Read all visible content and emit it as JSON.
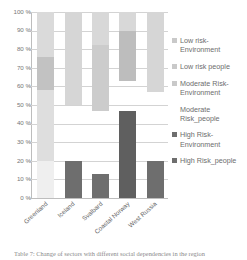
{
  "chart_data": {
    "type": "bar",
    "subtype": "stacked-percentage-column",
    "title": "",
    "xlabel": "",
    "ylabel": "",
    "ylim": [
      0,
      100
    ],
    "ytick_labels": [
      "100 %",
      "90 %",
      "80 %",
      "70 %",
      "60 %",
      "50 %",
      "40 %",
      "30 %",
      "20 %",
      "10 %",
      "0 %"
    ],
    "ytick_values": [
      100,
      90,
      80,
      70,
      60,
      50,
      40,
      30,
      20,
      10,
      0
    ],
    "grid": true,
    "legend_position": "right",
    "categories": [
      "Greenland",
      "Iceland",
      "Svalbard",
      "Coastal Norway",
      "West Russia"
    ],
    "series": [
      {
        "name": "Low risk-Environment",
        "color": "#d9d9d9",
        "values": [
          24,
          50,
          18,
          10,
          43
        ]
      },
      {
        "name": "Low risk people",
        "color": "#c4c4c4",
        "values": [
          18,
          0,
          35,
          27,
          0
        ]
      },
      {
        "name": "Moderate Risk-Environment",
        "color": "#dcdcdc",
        "values": [
          38,
          0,
          0,
          0,
          0
        ]
      },
      {
        "name": "Moderate Risk_people",
        "color": "#ffffff",
        "values": [
          0,
          30,
          34,
          16,
          37
        ]
      },
      {
        "name": "High Risk-Environment",
        "color": "#ffffff",
        "values": [
          0,
          0,
          0,
          0,
          0
        ]
      },
      {
        "name": "High Risk_people",
        "color": "#6e6e6e",
        "values": [
          20,
          20,
          13,
          47,
          20
        ]
      }
    ],
    "stack_segments": [
      {
        "category": "Greenland",
        "parts": [
          {
            "series": "Low risk-Environment",
            "from": 76,
            "to": 100,
            "color": "#dadada"
          },
          {
            "series": "Low risk people",
            "from": 58,
            "to": 76,
            "color": "#c2c2c2"
          },
          {
            "series": "Moderate Risk-Environment",
            "from": 20,
            "to": 58,
            "color": "#dedede"
          },
          {
            "series": "High Risk_people",
            "from": 0,
            "to": 20,
            "color": "#efefef"
          }
        ]
      },
      {
        "category": "Iceland",
        "parts": [
          {
            "series": "Low risk-Environment",
            "from": 50,
            "to": 100,
            "color": "#d6d6d6"
          },
          {
            "series": "High Risk_people",
            "from": 0,
            "to": 20,
            "color": "#6e6e6e"
          }
        ]
      },
      {
        "category": "Svalbard",
        "parts": [
          {
            "series": "Low risk-Environment",
            "from": 82,
            "to": 100,
            "color": "#d8d8d8"
          },
          {
            "series": "Low risk people",
            "from": 47,
            "to": 82,
            "color": "#cccccc"
          },
          {
            "series": "High Risk_people",
            "from": 0,
            "to": 13,
            "color": "#6e6e6e"
          }
        ]
      },
      {
        "category": "Coastal Norway",
        "parts": [
          {
            "series": "Low risk-Environment",
            "from": 90,
            "to": 100,
            "color": "#d8d8d8"
          },
          {
            "series": "Low risk people",
            "from": 63,
            "to": 90,
            "color": "#bdbdbd"
          },
          {
            "series": "High Risk_people",
            "from": 0,
            "to": 47,
            "color": "#5f5f5f"
          }
        ]
      },
      {
        "category": "West Russia",
        "parts": [
          {
            "series": "Low risk-Environment",
            "from": 57,
            "to": 100,
            "color": "#d6d6d6"
          },
          {
            "series": "High Risk_people",
            "from": 0,
            "to": 20,
            "color": "#6e6e6e"
          }
        ]
      }
    ]
  },
  "legend": {
    "items": [
      {
        "label": "Low risk-Environment",
        "color": "#c9c9c9"
      },
      {
        "label": "Low risk people",
        "color": "#c9c9c9"
      },
      {
        "label": "Moderate Risk-Environment",
        "color": "#c9c9c9"
      },
      {
        "label": "Moderate Risk_people",
        "color": "#ffffff"
      },
      {
        "label": "High Risk-Environment",
        "color": "#6e6e6e"
      },
      {
        "label": "High Risk_people",
        "color": "#6e6e6e"
      }
    ]
  },
  "caption": {
    "text": "Table 7: Change of  sectors with different social dependencies in the region"
  }
}
